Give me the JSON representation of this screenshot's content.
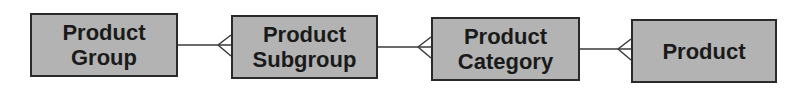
{
  "diagram": {
    "type": "entity-relationship",
    "entities": [
      {
        "id": "product-group",
        "lines": [
          "Product",
          "Group"
        ]
      },
      {
        "id": "product-subgroup",
        "lines": [
          "Product",
          "Subgroup"
        ]
      },
      {
        "id": "product-category",
        "lines": [
          "Product",
          "Category"
        ]
      },
      {
        "id": "product",
        "lines": [
          "Product"
        ]
      }
    ],
    "relationships": [
      {
        "from": "Product Group",
        "to": "Product Subgroup",
        "cardinality": "one-to-many"
      },
      {
        "from": "Product Subgroup",
        "to": "Product Category",
        "cardinality": "one-to-many"
      },
      {
        "from": "Product Category",
        "to": "Product",
        "cardinality": "one-to-many"
      }
    ],
    "colors": {
      "box_fill": "#b3b3b3",
      "border": "#2a2a2a",
      "line": "#3a3a3a"
    }
  }
}
